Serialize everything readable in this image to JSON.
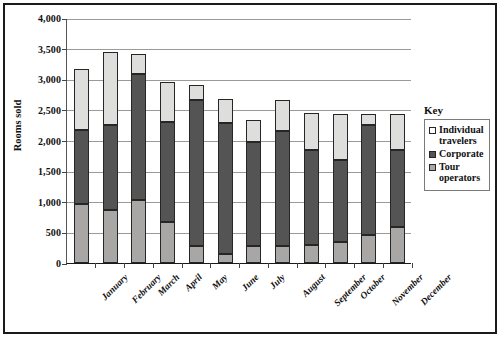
{
  "chart_data": {
    "type": "bar",
    "subtype": "stacked-bar",
    "title": "",
    "xlabel": "",
    "ylabel": "Rooms sold",
    "ylim": [
      0,
      4000
    ],
    "ytick_step": 500,
    "ytick_labels": [
      "0",
      "500",
      "1,000",
      "1,500",
      "2,000",
      "2,500",
      "3,000",
      "3,500",
      "4,000"
    ],
    "ytick_values": [
      0,
      500,
      1000,
      1500,
      2000,
      2500,
      3000,
      3500,
      4000
    ],
    "grid": true,
    "legend_position": "right",
    "legend_title": "Key",
    "categories": [
      "January",
      "February",
      "March",
      "April",
      "May",
      "June",
      "July",
      "August",
      "September",
      "October",
      "November",
      "December"
    ],
    "series": [
      {
        "name": "Tour operators",
        "color": "#a8a7a6",
        "stack_order": 1,
        "values": [
          970,
          860,
          1030,
          670,
          280,
          140,
          280,
          280,
          300,
          350,
          450,
          580
        ]
      },
      {
        "name": "Corporate",
        "color": "#555455",
        "stack_order": 2,
        "values": [
          1200,
          1400,
          2050,
          1630,
          2380,
          2140,
          1690,
          1870,
          1550,
          1330,
          1810,
          1270
        ]
      },
      {
        "name": "Individual travelers",
        "color": "#dededd",
        "stack_order": 3,
        "values": [
          1000,
          1190,
          340,
          650,
          250,
          390,
          360,
          510,
          600,
          760,
          180,
          590
        ]
      }
    ],
    "totals": [
      3170,
      3450,
      3420,
      2950,
      2910,
      2670,
      2330,
      2660,
      2450,
      2440,
      2440,
      2440
    ]
  },
  "legend": {
    "title": "Key",
    "items": [
      {
        "label": "Individual travelers",
        "swatch": "sw-individual"
      },
      {
        "label": "Corporate",
        "swatch": "sw-corporate"
      },
      {
        "label": "Tour operators",
        "swatch": "sw-tour"
      }
    ]
  },
  "axis": {
    "y_title": "Rooms sold"
  }
}
